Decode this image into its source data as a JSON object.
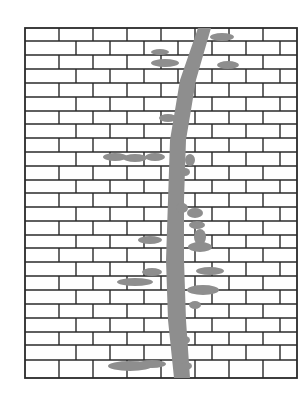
{
  "figure": {
    "colors": {
      "background": "#ffffff",
      "mortar_line": "#2a2a2a",
      "vine": "#8e8e8e"
    },
    "wall": {
      "x": 25,
      "y": 28,
      "w": 272,
      "h": 350
    },
    "courses": [
      28,
      41,
      55,
      69,
      83,
      97,
      111,
      124,
      138,
      152,
      166,
      180,
      193,
      207,
      221,
      235,
      248,
      262,
      276,
      290,
      304,
      318,
      332,
      345,
      360,
      378
    ],
    "brick_width": 34,
    "vine": {
      "trunk": [
        [
          198,
          28
        ],
        [
          211,
          28
        ],
        [
          196,
          80
        ],
        [
          186,
          140
        ],
        [
          184,
          200
        ],
        [
          184,
          260
        ],
        [
          186,
          320
        ],
        [
          190,
          378
        ],
        [
          174,
          378
        ],
        [
          168,
          320
        ],
        [
          166,
          260
        ],
        [
          168,
          200
        ],
        [
          170,
          140
        ],
        [
          180,
          80
        ]
      ],
      "leaves": [
        [
          222,
          37,
          12,
          4
        ],
        [
          228,
          65,
          11,
          4
        ],
        [
          160,
          52,
          9,
          3
        ],
        [
          165,
          63,
          14,
          4
        ],
        [
          168,
          118,
          9,
          4
        ],
        [
          115,
          157,
          12,
          4
        ],
        [
          135,
          158,
          12,
          4
        ],
        [
          155,
          157,
          10,
          4
        ],
        [
          190,
          160,
          5,
          6
        ],
        [
          185,
          172,
          5,
          4
        ],
        [
          182,
          208,
          6,
          5
        ],
        [
          195,
          213,
          8,
          5
        ],
        [
          197,
          225,
          8,
          4
        ],
        [
          150,
          240,
          12,
          4
        ],
        [
          200,
          237,
          6,
          8
        ],
        [
          200,
          247,
          12,
          5
        ],
        [
          152,
          272,
          10,
          4
        ],
        [
          210,
          271,
          14,
          4
        ],
        [
          135,
          282,
          18,
          4
        ],
        [
          203,
          290,
          16,
          5
        ],
        [
          195,
          305,
          6,
          4
        ],
        [
          185,
          340,
          5,
          4
        ],
        [
          130,
          366,
          22,
          5
        ],
        [
          152,
          364,
          14,
          4
        ],
        [
          186,
          366,
          6,
          4
        ]
      ]
    }
  }
}
